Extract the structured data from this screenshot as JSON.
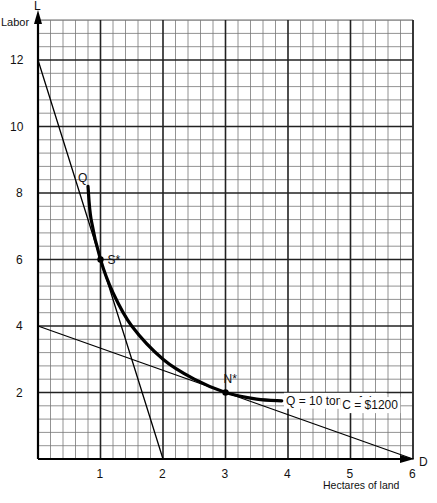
{
  "chart_data": {
    "type": "line",
    "title": "",
    "xlabel": "Hectares of land",
    "ylabel": "Labor",
    "x_axis_letter": "D",
    "y_axis_letter": "L",
    "xlim": [
      0,
      6
    ],
    "ylim": [
      0,
      13.2
    ],
    "grid": true,
    "x_ticks": [
      1,
      2,
      3,
      4,
      5,
      6
    ],
    "y_ticks": [
      2,
      4,
      6,
      8,
      10,
      12
    ],
    "series": [
      {
        "name": "Q = 10  tons of rice",
        "label_start": "Q",
        "style": "thick",
        "x": [
          0.8,
          0.85,
          1.0,
          1.2,
          1.5,
          2.0,
          2.5,
          3.0,
          3.5,
          3.9
        ],
        "y": [
          8.2,
          7.2,
          6.0,
          5.0,
          4.0,
          3.0,
          2.4,
          2.0,
          1.8,
          1.75
        ]
      },
      {
        "name": "Isocost line (steep)",
        "style": "thin",
        "x": [
          0,
          2
        ],
        "y": [
          12,
          0
        ]
      },
      {
        "name": "C = $1200",
        "style": "thin",
        "x": [
          0,
          6
        ],
        "y": [
          4,
          0
        ]
      }
    ],
    "annotations": [
      {
        "label": "S*",
        "x": 1,
        "y": 6
      },
      {
        "label": "N*",
        "x": 3,
        "y": 2
      },
      {
        "label": "Q = 10  tons of rice",
        "x": 4.0,
        "y": 1.75
      },
      {
        "label": "C = $1200",
        "x": 4.9,
        "y": 1.2
      }
    ]
  }
}
